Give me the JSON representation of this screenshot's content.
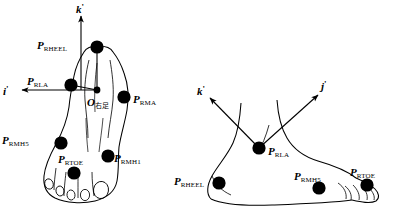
{
  "figure": {
    "title": "",
    "background": "#ffffff",
    "stroke_color": "#000000",
    "marker_color": "#000000"
  },
  "left_view": {
    "name": "right-foot-dorsal-view",
    "origin": {
      "base": "O",
      "subscript": "右足",
      "x": 97,
      "y": 90
    },
    "axes": [
      {
        "label": "k",
        "prime": "'",
        "name": "k-axis",
        "x": 76,
        "y": 2,
        "dir": "up"
      },
      {
        "label": "i",
        "prime": "'",
        "name": "i-axis",
        "x": 3,
        "y": 84,
        "dir": "left"
      }
    ],
    "markers": [
      {
        "label": "P",
        "subscript": "RHEEL",
        "name": "marker-rheel",
        "cx": 97,
        "cy": 47,
        "r": 6.5,
        "lx": 37,
        "ly": 36
      },
      {
        "label": "P",
        "subscript": "RLA",
        "name": "marker-rla",
        "cx": 71,
        "cy": 85,
        "r": 6.5,
        "lx": 27,
        "ly": 73
      },
      {
        "label": "P",
        "subscript": "RMA",
        "name": "marker-rma",
        "cx": 124,
        "cy": 97,
        "r": 6.5,
        "lx": 133,
        "ly": 90
      },
      {
        "label": "P",
        "subscript": "RMH5",
        "name": "marker-rmh5",
        "cx": 61,
        "cy": 143,
        "r": 6.5,
        "lx": 3,
        "ly": 131
      },
      {
        "label": "P",
        "subscript": "RMH1",
        "name": "marker-rmh1",
        "cx": 108,
        "cy": 156,
        "r": 6.5,
        "lx": 114,
        "ly": 149
      },
      {
        "label": "P",
        "subscript": "RTOE",
        "name": "marker-rtoe",
        "cx": 74,
        "cy": 173,
        "r": 6.5,
        "lx": 59,
        "ly": 150
      }
    ]
  },
  "right_view": {
    "name": "right-foot-lateral-view",
    "axes": [
      {
        "label": "k",
        "prime": "'",
        "name": "k-axis",
        "x": 197,
        "y": 85,
        "dir": "upleft"
      },
      {
        "label": "j",
        "prime": "'",
        "name": "j-axis",
        "x": 321,
        "y": 80,
        "dir": "upright"
      }
    ],
    "markers": [
      {
        "label": "P",
        "subscript": "RLA",
        "name": "marker-rla",
        "cx": 259,
        "cy": 148,
        "r": 6.5,
        "lx": 268,
        "ly": 142
      },
      {
        "label": "P",
        "subscript": "RHEEL",
        "name": "marker-rheel",
        "cx": 219,
        "cy": 183,
        "r": 6.5,
        "lx": 175,
        "ly": 172
      },
      {
        "label": "P",
        "subscript": "RMH5",
        "name": "marker-rmh5",
        "cx": 319,
        "cy": 188,
        "r": 6.5,
        "lx": 295,
        "ly": 167
      },
      {
        "label": "P",
        "subscript": "RTOE",
        "name": "marker-rtoe",
        "cx": 367,
        "cy": 185,
        "r": 6.5,
        "lx": 351,
        "ly": 163
      }
    ]
  }
}
